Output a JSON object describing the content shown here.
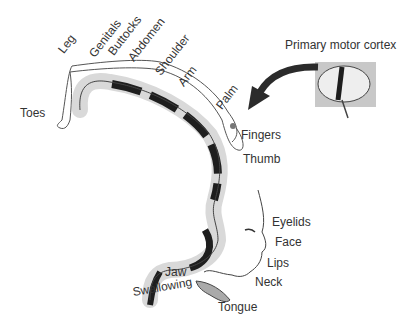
{
  "diagram": {
    "inset_label": "Primary motor cortex",
    "labels": {
      "toes": "Toes",
      "leg": "Leg",
      "genitals": "Genitals",
      "buttocks": "Buttocks",
      "abdomen": "Abdomen",
      "shoulder": "Shoulder",
      "arm": "Arm",
      "palm": "Palm",
      "fingers": "Fingers",
      "thumb": "Thumb",
      "eyelids": "Eyelids",
      "face": "Face",
      "lips": "Lips",
      "neck": "Neck",
      "jaw": "Jaw",
      "swallowing": "Swallowing",
      "tongue": "Tongue"
    },
    "colors": {
      "cortex_light": "#d9d9d9",
      "cortex_dark": "#1e1e1e",
      "outline": "#333333",
      "inset_bg": "#c8c8c8",
      "arrow": "#2b2b2b"
    }
  }
}
